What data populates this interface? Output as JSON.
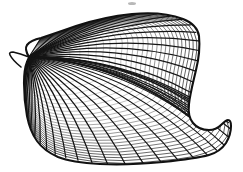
{
  "figure": {
    "domain": "Natural-Image",
    "subject_name": "bivalve-shell",
    "description": "Monochrome scientific line drawing of a single bivalve (clam/scallop) shell valve shown in outer-surface view, ornamented with closely spaced radial ribs crossed by fine concentric growth lines along the ventral margin.",
    "technique": "pen-and-ink engraving / stipple-free hatching",
    "orientation": "ventral margin lower, umbo and hinge at upper left, posterior lobe at right",
    "canvas": {
      "width": 243,
      "height": 172,
      "background_color": "#ffffff",
      "ink_color": "#111111"
    }
  },
  "style": {
    "outline_color": "#111111",
    "outline_width": 2.1,
    "rib_color": "#151515",
    "rib_width": 1.25,
    "growth_line_color": "#1a1a1a",
    "growth_line_width": 0.75,
    "speck_color": "#b8b8b8"
  },
  "geometry": {
    "outline_path": "M 29 57 C 26 52 25 48 27 45 C 30 41 36 39 41 38 C 50 35 62 31 76 26 C 94 20 112 16 132 14 C 152 12 170 14 183 19 C 193 23 198 29 199 36 C 200 46 199 58 196 70 C 193 83 190 94 189 104 C 188 112 189 118 193 123 C 197 128 203 130 209 130 C 214 130 218 128 221 125 C 224 122 226 120 228 120 C 230 120 231 122 231 126 C 231 132 229 138 226 143 C 222 149 216 153 209 155 C 198 158 182 160 163 162 C 142 164 120 165 100 164 C 82 163 68 161 58 157 C 49 153 42 148 37 141 C 32 134 29 126 27 116 C 25 105 24 94 24 83 C 24 74 25 67 27 62 C 28 59 29 58 29 57 Z",
    "umbo": {
      "x": 29,
      "y": 57
    },
    "beak_tip": {
      "x": 10,
      "y": 53
    },
    "posterior_notch": {
      "x": 214,
      "y": 128
    },
    "ventral_extreme": {
      "x": 120,
      "y": 165
    },
    "anterior_extreme": {
      "x": 9,
      "y": 53
    },
    "posterior_extreme": {
      "x": 232,
      "y": 133
    }
  },
  "ornament": {
    "radial_rib_count": 52,
    "radial_ribs_note": "fine raised ribs radiating from the umbo at upper left, fanning to the ventral and posterior margins",
    "growth_line_count": 26,
    "growth_lines_note": "concentric growth increments, visible mainly as cross-hatching on the lower third of the valve",
    "crosshatch_zone": "ventral band, lower third of the valve"
  },
  "marks": {
    "speck": {
      "present": true,
      "x": 128,
      "y": 2,
      "width": 8,
      "height": 3,
      "label": "faint scan artifact speck at top edge"
    }
  }
}
